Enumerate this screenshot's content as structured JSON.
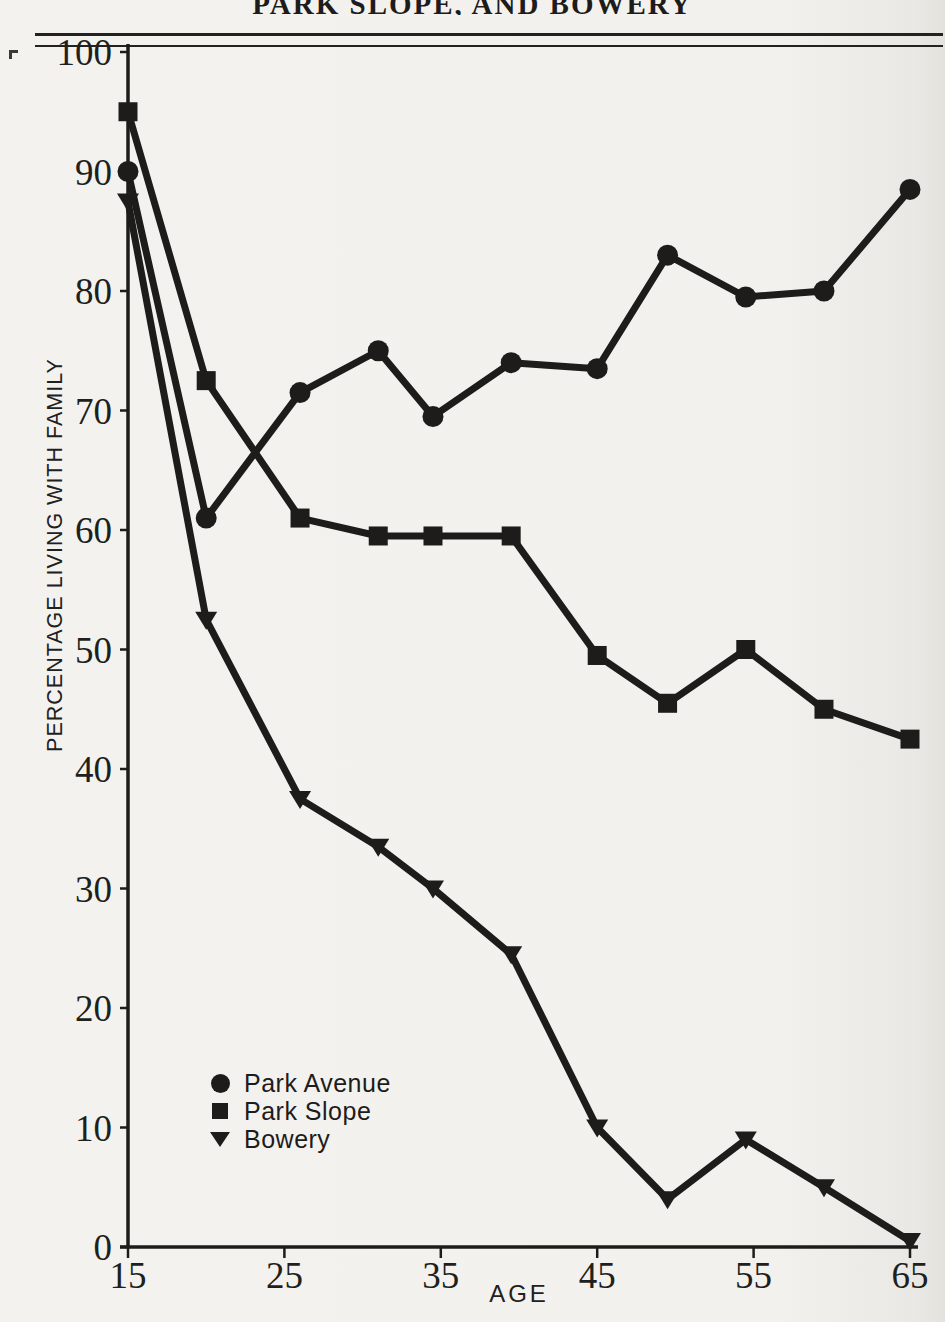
{
  "page": {
    "running_head_clipped": "PARK SLOPE, AND BOWERY"
  },
  "chart_data": {
    "type": "line",
    "xlabel": "AGE",
    "ylabel": "PERCENTAGE LIVING WITH FAMILY",
    "xlim": [
      15,
      65
    ],
    "ylim": [
      0,
      100
    ],
    "x_ticks": [
      15,
      25,
      35,
      45,
      55,
      65
    ],
    "y_ticks": [
      0,
      10,
      20,
      30,
      40,
      50,
      60,
      70,
      80,
      90,
      100
    ],
    "grid": false,
    "legend_position": "inside lower-left",
    "line_color": "#1d1c1a",
    "x": [
      15,
      20,
      26,
      31,
      34.5,
      39.5,
      45,
      49.5,
      54.5,
      59.5,
      65
    ],
    "series": [
      {
        "name": "Park Avenue",
        "marker": "circle",
        "values": [
          90,
          61,
          71.5,
          75,
          69.5,
          74,
          73.5,
          83,
          79.5,
          80,
          88.5
        ]
      },
      {
        "name": "Park Slope",
        "marker": "square",
        "values": [
          95,
          72.5,
          61,
          59.5,
          59.5,
          59.5,
          49.5,
          45.5,
          50,
          45,
          42.5
        ]
      },
      {
        "name": "Bowery",
        "marker": "triangle-down",
        "values": [
          87.5,
          52.5,
          37.5,
          33.5,
          30,
          24.5,
          10,
          4,
          9,
          5,
          0.5
        ]
      }
    ]
  }
}
